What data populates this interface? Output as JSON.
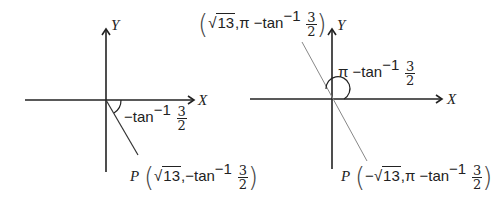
{
  "diagrams": [
    {
      "id": "left",
      "axes": {
        "x_label": "X",
        "y_label": "Y",
        "origin": [
          106,
          100
        ]
      },
      "angle_label": {
        "prefix": "−tan",
        "sup": "−1",
        "num": "3",
        "den": "2"
      },
      "point_label": {
        "name": "P",
        "r_sign": "",
        "r_rad": "13",
        "sep": ",",
        "theta_prefix": "−tan",
        "sup": "−1",
        "num": "3",
        "den": "2"
      }
    },
    {
      "id": "right",
      "axes": {
        "x_label": "X",
        "y_label": "Y",
        "origin": [
          332,
          99
        ]
      },
      "angle_label": {
        "prefix": "π −tan",
        "sup": "−1",
        "num": "3",
        "den": "2"
      },
      "top_point_label": {
        "r_sign": "",
        "r_rad": "13",
        "sep": ",",
        "theta_prefix": "π −tan",
        "sup": "−1",
        "num": "3",
        "den": "2"
      },
      "point_label": {
        "name": "P",
        "r_sign": "−",
        "r_rad": "13",
        "sep": ",",
        "theta_prefix": "π −tan",
        "sup": "−1",
        "num": "3",
        "den": "2"
      }
    }
  ],
  "colors": {
    "axis": "#222222",
    "ray": "#333333",
    "thin_line": "#888888"
  }
}
